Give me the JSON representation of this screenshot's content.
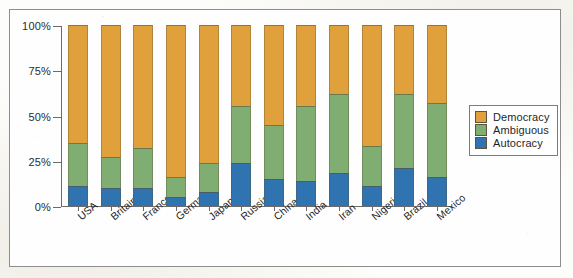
{
  "chart_data": {
    "type": "bar",
    "subtype": "stacked-bar-100-percent",
    "title": "",
    "xlabel": "",
    "ylabel": "",
    "ylim": [
      0,
      100
    ],
    "y_ticks": [
      0,
      25,
      50,
      75,
      100
    ],
    "y_tick_labels": [
      "0%",
      "25%",
      "50%",
      "75%",
      "100%"
    ],
    "grid": false,
    "legend_position": "right",
    "stack_order_bottom_to_top": [
      "Autocracy",
      "Ambiguous",
      "Democracy"
    ],
    "categories": [
      "USA",
      "Britain",
      "France",
      "Germany",
      "Japan",
      "Russia",
      "China",
      "India",
      "Iran",
      "Nigeria",
      "Brazil",
      "Mexico"
    ],
    "series": [
      {
        "name": "Autocracy",
        "color": "#2f73b0",
        "values": [
          11,
          10,
          10,
          5,
          8,
          24,
          15,
          14,
          18,
          11,
          21,
          16
        ]
      },
      {
        "name": "Ambiguous",
        "color": "#7fad72",
        "values": [
          24,
          17,
          22,
          11,
          16,
          31,
          30,
          41,
          44,
          22,
          41,
          41
        ]
      },
      {
        "name": "Democracy",
        "color": "#e0a03c",
        "values": [
          65,
          73,
          68,
          84,
          76,
          45,
          55,
          45,
          38,
          67,
          38,
          43
        ]
      }
    ],
    "cumulative_tops": {
      "Autocracy": [
        11,
        10,
        10,
        5,
        8,
        24,
        15,
        14,
        18,
        11,
        21,
        16
      ],
      "Ambiguous": [
        35,
        27,
        32,
        16,
        24,
        55,
        45,
        55,
        62,
        33,
        62,
        57
      ],
      "Democracy": [
        100,
        100,
        100,
        100,
        100,
        100,
        100,
        100,
        100,
        100,
        100,
        100
      ]
    }
  },
  "legend": {
    "items": [
      {
        "label": "Democracy",
        "color": "#e0a03c"
      },
      {
        "label": "Ambiguous",
        "color": "#7fad72"
      },
      {
        "label": "Autocracy",
        "color": "#2f73b0"
      }
    ]
  },
  "colors": {
    "democracy": "#e0a03c",
    "ambiguous": "#7fad72",
    "autocracy": "#2f73b0",
    "bar_background": "#f2f0dc",
    "axis": "#6a6a6a",
    "frame": "#8d8d8d",
    "text": "#1f1f1f"
  }
}
